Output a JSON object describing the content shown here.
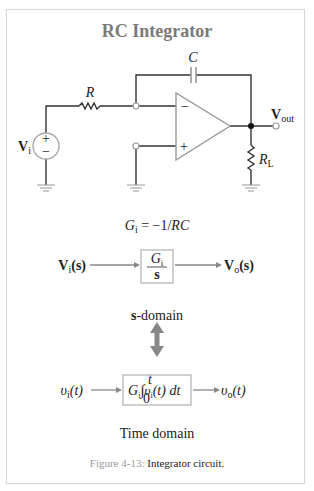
{
  "title": "RC Integrator",
  "circuit": {
    "capacitor_label": "C",
    "resistor_label": "R",
    "load_label_main": "R",
    "load_label_sub": "L",
    "source_label_main": "V",
    "source_label_sub": "i",
    "source_plus": "+",
    "source_minus": "−",
    "opamp_minus": "−",
    "opamp_plus": "+",
    "output_label_main": "V",
    "output_label_sub": "out"
  },
  "gain_equation": {
    "lhs_main": "G",
    "lhs_sub": "i",
    "rhs": " = −1/",
    "rhs_var": "RC"
  },
  "s_domain": {
    "input_main": "V",
    "input_sub": "i",
    "input_arg": "(s)",
    "block_num_main": "G",
    "block_num_sub": "i",
    "block_den": "s",
    "output_main": "V",
    "output_sub": "o",
    "output_arg": "(s)",
    "label_bold": "s",
    "label_rest": "-domain"
  },
  "time_domain": {
    "input_main": "υ",
    "input_sub": "i",
    "input_arg": "(t)",
    "block_gain_main": "G",
    "block_gain_sub": "i",
    "integral_symbol": "∫",
    "integral_upper": "t",
    "integral_lower": "0",
    "integrand_main": "υ",
    "integrand_sub": "i",
    "integrand_arg": "(t) dt",
    "output_main": "υ",
    "output_sub": "o",
    "output_arg": "(t)",
    "label": "Time domain"
  },
  "caption": {
    "figure_number": "Figure 4-13:",
    "text": " Integrator circuit."
  },
  "colors": {
    "title": "#7a7a7a",
    "wire": "#333333",
    "component_gray": "#9a9a9a",
    "caption_number": "#9a9a9a",
    "frame": "#d8d8d8"
  }
}
